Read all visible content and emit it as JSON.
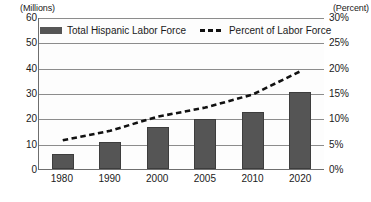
{
  "chart_data": {
    "type": "bar",
    "title": "",
    "xlabel": "",
    "ylabel": "(Millions)",
    "y2label": "(Percent)",
    "categories": [
      "1980",
      "1990",
      "2000",
      "2005",
      "2010",
      "2020"
    ],
    "ylim": [
      0,
      60
    ],
    "y2lim": [
      0,
      30
    ],
    "yticks": [
      "60",
      "50",
      "40",
      "30",
      "20",
      "10",
      "0"
    ],
    "ytick_values": [
      60,
      50,
      40,
      30,
      20,
      10,
      0
    ],
    "y2ticks": [
      "30%",
      "25%",
      "20%",
      "15%",
      "10%",
      "5%",
      "0%"
    ],
    "y2tick_values": [
      30,
      25,
      20,
      15,
      10,
      5,
      0
    ],
    "grid": true,
    "legend_position": "top-left",
    "series": [
      {
        "name": "Total Hispanic Labor Force",
        "type": "bar",
        "axis": "left",
        "unit": "millions",
        "color": "#555555",
        "values": [
          6.1,
          10.7,
          16.7,
          19.7,
          22.4,
          30.5
        ]
      },
      {
        "name": "Percent of Labor Force",
        "type": "line",
        "style": "dashed",
        "axis": "right",
        "unit": "percent",
        "color": "#111111",
        "values": [
          5.7,
          7.6,
          10.4,
          12.2,
          14.8,
          19.4
        ]
      }
    ]
  },
  "legend": {
    "items": [
      {
        "label": "Total Hispanic Labor Force",
        "marker": "bar-swatch"
      },
      {
        "label": "Percent of Labor Force",
        "marker": "dashed-line-swatch"
      }
    ]
  }
}
